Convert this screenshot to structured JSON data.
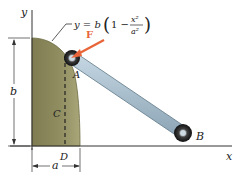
{
  "figure": {
    "equation": {
      "lhs": "y = b",
      "paren_open": "(",
      "one_minus": "1 −",
      "numerator": "x²",
      "denominator": "a²",
      "paren_close": ")"
    },
    "labels": {
      "y_axis": "y",
      "x_axis": "x",
      "force": "F",
      "point_a": "A",
      "point_b": "B",
      "point_c": "C",
      "point_d": "D",
      "dim_b": "b",
      "dim_a": "a"
    },
    "colors": {
      "region_fill": "#8c8a5c",
      "region_edge": "#6b6940",
      "force_arrow": "#e8653a",
      "rod": "#9fb8c8",
      "rod_edge": "#5f7888",
      "roller": "#2a2a2a",
      "axis": "#333333"
    }
  }
}
